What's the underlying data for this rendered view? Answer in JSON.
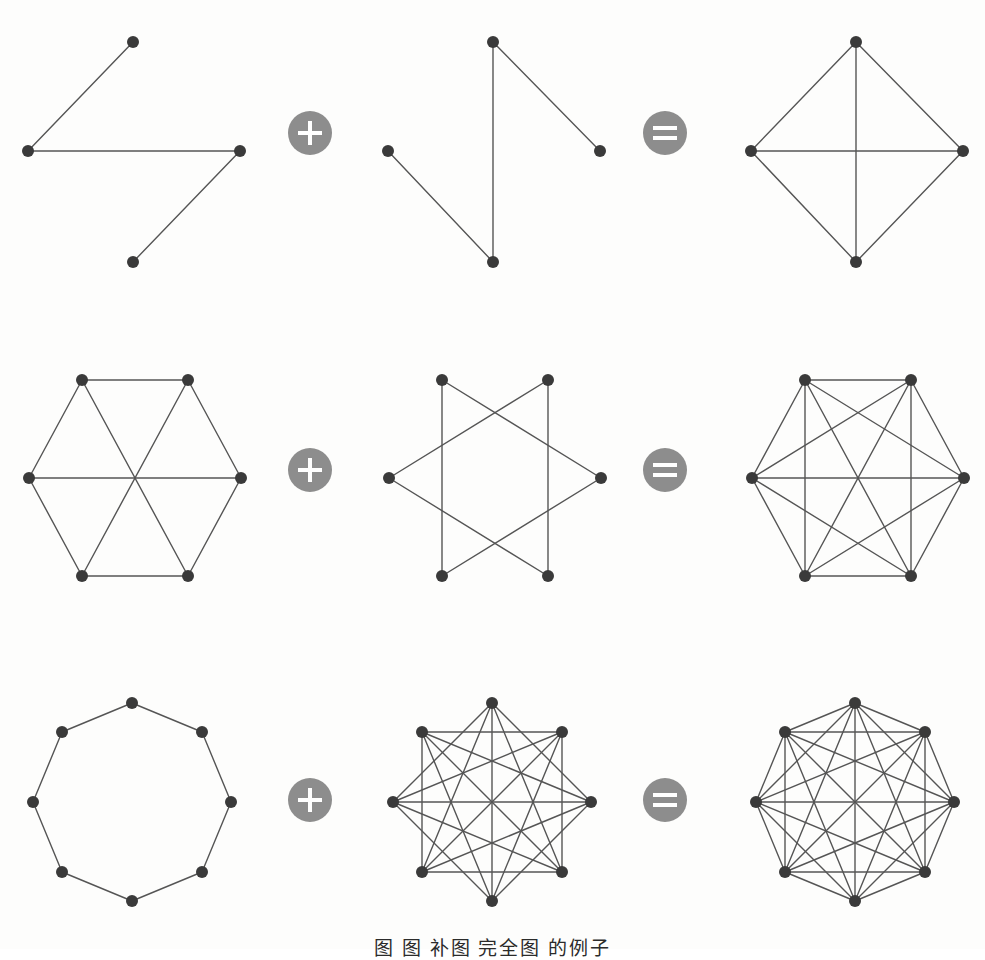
{
  "figure": {
    "background_color": "#fdfdfc",
    "node_color": "#3a3a3a",
    "edge_color": "#555555",
    "operator_circle_color": "#8d8d8d",
    "operator_glyph_color": "#ffffff",
    "node_radius": 6,
    "edge_width": 1.4,
    "caption": "图  图  补图  完全图  的例子"
  },
  "operators": {
    "plus": {
      "symbol": "+",
      "name": "plus-operator",
      "radius": 22
    },
    "equals": {
      "symbol": "=",
      "name": "equals-operator",
      "radius": 22
    }
  },
  "chart_data": {
    "type": "diagram",
    "subtype": "graph-complement-identity",
    "rows": [
      {
        "index": 1,
        "n": 4,
        "label": "n = 4",
        "layout": "diamond",
        "y_top": 10,
        "height": 270,
        "vertices": [
          {
            "id": 0,
            "x": 124,
            "y": 23,
            "name": "top"
          },
          {
            "id": 1,
            "x": 19,
            "y": 132,
            "name": "left"
          },
          {
            "id": 2,
            "x": 231,
            "y": 132,
            "name": "right"
          },
          {
            "id": 3,
            "x": 124,
            "y": 243,
            "name": "bottom"
          }
        ],
        "panels": [
          {
            "role": "operand-a",
            "name": "graph-g",
            "x_offset": 0,
            "edge_count": 3,
            "edges": [
              [
                0,
                1
              ],
              [
                1,
                2
              ],
              [
                2,
                3
              ]
            ]
          },
          {
            "role": "operand-b",
            "name": "graph-complement",
            "x_offset": 360,
            "edge_count": 3,
            "edges": [
              [
                0,
                3
              ],
              [
                0,
                2
              ],
              [
                1,
                3
              ]
            ]
          },
          {
            "role": "result",
            "name": "complete-graph-k4",
            "x_offset": 723,
            "edge_count": 6,
            "edges": [
              [
                0,
                1
              ],
              [
                0,
                2
              ],
              [
                0,
                3
              ],
              [
                1,
                2
              ],
              [
                1,
                3
              ],
              [
                2,
                3
              ]
            ]
          }
        ],
        "operator_positions": [
          {
            "type": "plus",
            "cx": 310,
            "cy": 133
          },
          {
            "type": "equals",
            "cx": 665,
            "cy": 133
          }
        ]
      },
      {
        "index": 2,
        "n": 6,
        "label": "n = 6",
        "layout": "hexagon",
        "y_top": 350,
        "height": 240,
        "vertices": [
          {
            "id": 0,
            "x": 63,
            "y": 21,
            "name": "top-left"
          },
          {
            "id": 1,
            "x": 169,
            "y": 21,
            "name": "top-right"
          },
          {
            "id": 2,
            "x": 222,
            "y": 119,
            "name": "right"
          },
          {
            "id": 3,
            "x": 169,
            "y": 217,
            "name": "bottom-right"
          },
          {
            "id": 4,
            "x": 63,
            "y": 217,
            "name": "bottom-left"
          },
          {
            "id": 5,
            "x": 10,
            "y": 119,
            "name": "left"
          }
        ],
        "panels": [
          {
            "role": "operand-a",
            "name": "graph-g",
            "x_offset": 10,
            "edge_count": 9,
            "edges": [
              [
                0,
                1
              ],
              [
                1,
                2
              ],
              [
                2,
                3
              ],
              [
                3,
                4
              ],
              [
                4,
                5
              ],
              [
                5,
                0
              ],
              [
                0,
                3
              ],
              [
                1,
                4
              ],
              [
                2,
                5
              ]
            ]
          },
          {
            "role": "operand-b",
            "name": "graph-complement",
            "x_offset": 370,
            "edge_count": 6,
            "edges": [
              [
                0,
                2
              ],
              [
                2,
                4
              ],
              [
                4,
                0
              ],
              [
                1,
                3
              ],
              [
                3,
                5
              ],
              [
                5,
                1
              ]
            ]
          },
          {
            "role": "result",
            "name": "complete-graph-k6",
            "x_offset": 733,
            "edge_count": 15,
            "edges": [
              [
                0,
                1
              ],
              [
                0,
                2
              ],
              [
                0,
                3
              ],
              [
                0,
                4
              ],
              [
                0,
                5
              ],
              [
                1,
                2
              ],
              [
                1,
                3
              ],
              [
                1,
                4
              ],
              [
                1,
                5
              ],
              [
                2,
                3
              ],
              [
                2,
                4
              ],
              [
                2,
                5
              ],
              [
                3,
                4
              ],
              [
                3,
                5
              ],
              [
                4,
                5
              ]
            ]
          }
        ],
        "operator_positions": [
          {
            "type": "plus",
            "cx": 310,
            "cy": 470
          },
          {
            "type": "equals",
            "cx": 665,
            "cy": 470
          }
        ]
      },
      {
        "index": 3,
        "n": 8,
        "label": "n = 8",
        "layout": "octagon",
        "y_top": 680,
        "height": 240,
        "vertices": [
          {
            "id": 0,
            "x": 113,
            "y": 14,
            "name": "top"
          },
          {
            "id": 1,
            "x": 183,
            "y": 43,
            "name": "top-right"
          },
          {
            "id": 2,
            "x": 212,
            "y": 113,
            "name": "right"
          },
          {
            "id": 3,
            "x": 183,
            "y": 183,
            "name": "bottom-right"
          },
          {
            "id": 4,
            "x": 113,
            "y": 212,
            "name": "bottom"
          },
          {
            "id": 5,
            "x": 43,
            "y": 183,
            "name": "bottom-left"
          },
          {
            "id": 6,
            "x": 14,
            "y": 113,
            "name": "left"
          },
          {
            "id": 7,
            "x": 43,
            "y": 43,
            "name": "top-left"
          }
        ],
        "panels": [
          {
            "role": "operand-a",
            "name": "graph-g",
            "x_offset": 10,
            "edge_count": 8,
            "edges": [
              [
                0,
                1
              ],
              [
                1,
                2
              ],
              [
                2,
                3
              ],
              [
                3,
                4
              ],
              [
                4,
                5
              ],
              [
                5,
                6
              ],
              [
                6,
                7
              ],
              [
                7,
                0
              ]
            ]
          },
          {
            "role": "operand-b",
            "name": "graph-complement",
            "x_offset": 370,
            "edge_count": 20,
            "edges": [
              [
                0,
                2
              ],
              [
                0,
                3
              ],
              [
                0,
                4
              ],
              [
                0,
                5
              ],
              [
                0,
                6
              ],
              [
                1,
                3
              ],
              [
                1,
                4
              ],
              [
                1,
                5
              ],
              [
                1,
                6
              ],
              [
                1,
                7
              ],
              [
                2,
                4
              ],
              [
                2,
                5
              ],
              [
                2,
                6
              ],
              [
                2,
                7
              ],
              [
                3,
                5
              ],
              [
                3,
                6
              ],
              [
                3,
                7
              ],
              [
                4,
                6
              ],
              [
                4,
                7
              ],
              [
                5,
                7
              ]
            ]
          },
          {
            "role": "result",
            "name": "complete-graph-k8",
            "x_offset": 733,
            "edge_count": 28,
            "edges": [
              [
                0,
                1
              ],
              [
                0,
                2
              ],
              [
                0,
                3
              ],
              [
                0,
                4
              ],
              [
                0,
                5
              ],
              [
                0,
                6
              ],
              [
                0,
                7
              ],
              [
                1,
                2
              ],
              [
                1,
                3
              ],
              [
                1,
                4
              ],
              [
                1,
                5
              ],
              [
                1,
                6
              ],
              [
                1,
                7
              ],
              [
                2,
                3
              ],
              [
                2,
                4
              ],
              [
                2,
                5
              ],
              [
                2,
                6
              ],
              [
                2,
                7
              ],
              [
                3,
                4
              ],
              [
                3,
                5
              ],
              [
                3,
                6
              ],
              [
                3,
                7
              ],
              [
                4,
                5
              ],
              [
                4,
                6
              ],
              [
                4,
                7
              ],
              [
                5,
                6
              ],
              [
                5,
                7
              ],
              [
                6,
                7
              ]
            ]
          }
        ],
        "operator_positions": [
          {
            "type": "plus",
            "cx": 310,
            "cy": 800
          },
          {
            "type": "equals",
            "cx": 665,
            "cy": 800
          }
        ]
      }
    ]
  }
}
